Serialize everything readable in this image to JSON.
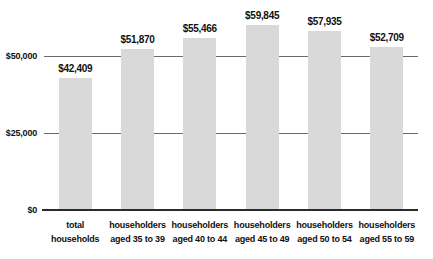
{
  "chart_data": {
    "type": "bar",
    "title": "",
    "xlabel": "",
    "ylabel": "",
    "categories": [
      "total households",
      "householders aged 35 to 39",
      "householders aged 40 to 44",
      "householders aged 45 to 49",
      "householders aged 50 to 54",
      "householders aged 55 to 59"
    ],
    "category_lines": [
      [
        "total",
        "households"
      ],
      [
        "householders",
        "aged 35 to 39"
      ],
      [
        "householders",
        "aged 40 to 44"
      ],
      [
        "householders",
        "aged 45 to 49"
      ],
      [
        "householders",
        "aged 50 to 54"
      ],
      [
        "householders",
        "aged 55 to 59"
      ]
    ],
    "values": [
      42409,
      51870,
      55466,
      59845,
      57935,
      52709
    ],
    "value_labels": [
      "$42,409",
      "$51,870",
      "$55,466",
      "$59,845",
      "$57,935",
      "$52,709"
    ],
    "y_ticks": [
      {
        "value": 0,
        "label": "$0"
      },
      {
        "value": 25000,
        "label": "$25,000"
      },
      {
        "value": 50000,
        "label": "$50,000"
      }
    ],
    "ylim": [
      0,
      68500
    ],
    "grid": "horizontal",
    "legend": "none",
    "colors": {
      "bar": "#d9d9d9",
      "gridline": "#6b6b6b",
      "axis": "#2b2b2b",
      "text": "#111111",
      "background": "#ffffff"
    }
  }
}
